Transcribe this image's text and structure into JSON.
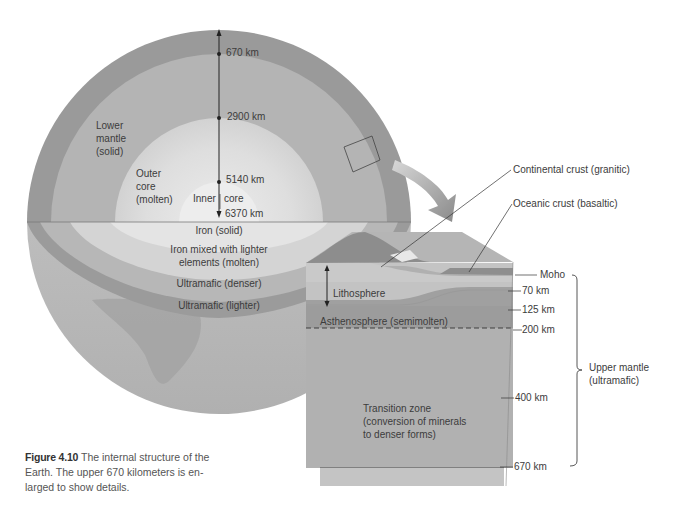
{
  "sphere": {
    "depth_labels": [
      "670 km",
      "2900 km",
      "5140 km",
      "6370 km"
    ],
    "lower_mantle": [
      "Lower",
      "mantle",
      "(solid)"
    ],
    "outer_core": [
      "Outer",
      "core",
      "(molten)"
    ],
    "inner_core_left": "Inner",
    "inner_core_right": "core",
    "cut_face": {
      "iron_solid": "Iron (solid)",
      "iron_mixed_1": "Iron mixed with lighter",
      "iron_mixed_2": "elements (molten)",
      "ultramafic_denser": "Ultramafic (denser)",
      "ultramafic_lighter": "Ultramafic (lighter)"
    }
  },
  "block": {
    "continental_crust": "Continental crust (granitic)",
    "oceanic_crust": "Oceanic crust (basaltic)",
    "lithosphere": "Lithosphere",
    "asthenosphere": "Asthenosphere (semimolten)",
    "transition_zone": [
      "Transition zone",
      "(conversion of minerals",
      "to denser forms)"
    ],
    "depths": {
      "moho": "Moho",
      "d70": "70 km",
      "d125": "125 km",
      "d200": "200 km",
      "d400": "400 km",
      "d670": "670 km"
    },
    "bracket_label": [
      "Upper mantle",
      "(ultramafic)"
    ]
  },
  "caption": {
    "figure_number": "Figure 4.10",
    "text_line1": " The internal structure of the",
    "text_line2": "Earth. The upper 670 kilometers is en-",
    "text_line3": "larged to show details."
  },
  "colors": {
    "crust": "#8e8e8e",
    "lower_mantle": "#b3b3b3",
    "outer_core": "#d8d8d8",
    "inner_core": "#e6e6e6",
    "asthenosphere": "#9c9c9c",
    "transition_zone": "#b0b0b0"
  }
}
